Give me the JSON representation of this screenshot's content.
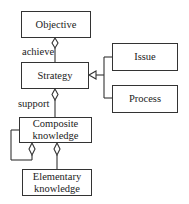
{
  "diagram": {
    "nodes": {
      "objective": "Objective",
      "strategy": "Strategy",
      "issue": "Issue",
      "process": "Process",
      "composite_line1": "Composite",
      "composite_line2": "knowledge",
      "elementary_line1": "Elementary",
      "elementary_line2": "knowledge"
    },
    "edges": {
      "achieve": "achieve",
      "support": "support"
    }
  }
}
